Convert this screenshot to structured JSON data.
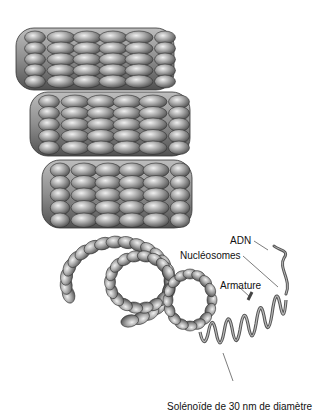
{
  "figure": {
    "colors": {
      "bead_light": "#e6e6e6",
      "bead_mid": "#a0a0a0",
      "bead_dark": "#4a4a4a",
      "outline": "#333333",
      "leader": "#444444"
    }
  },
  "labels": {
    "adn": "ADN",
    "nucleosomes": "Nucléosomes",
    "armature": "Armature",
    "solenoid": "Solénoïde de 30 nm de diamètre"
  }
}
